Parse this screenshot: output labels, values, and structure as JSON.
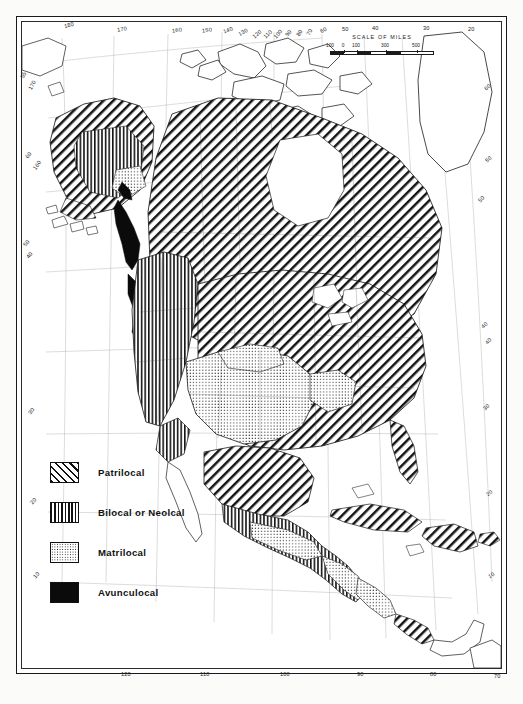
{
  "map": {
    "title": "North America residence pattern distribution map",
    "scale": {
      "title": "SCALE OF MILES",
      "labels": [
        "100",
        "0",
        "100",
        "300",
        "500"
      ],
      "positions": [
        0,
        13,
        26,
        55,
        86
      ]
    },
    "legend": {
      "items": [
        {
          "pattern": "diagonal-hatch",
          "label": "Patrilocal",
          "swatch_class": "sw-patri"
        },
        {
          "pattern": "vertical-lines",
          "label": "Bilocal or Neolcal",
          "swatch_class": "sw-bilocal"
        },
        {
          "pattern": "dotted",
          "label": "Matrilocal",
          "swatch_class": "sw-matri"
        },
        {
          "pattern": "solid-black",
          "label": "Avunculocal",
          "swatch_class": "sw-avunc"
        }
      ]
    },
    "graticule": {
      "top_labels": [
        "180",
        "170",
        "160",
        "150",
        "140",
        "130",
        "120",
        "110",
        "100",
        "90",
        "80",
        "70",
        "60",
        "50",
        "40",
        "30",
        "20"
      ],
      "bottom_labels": [
        "120",
        "110",
        "100",
        "90",
        "80",
        "70"
      ],
      "left_labels": [
        "55",
        "60",
        "50",
        "40",
        "30",
        "20",
        "10"
      ],
      "right_labels": [
        "60",
        "50",
        "40",
        "30",
        "20",
        "10"
      ],
      "right_meridian_labels": [
        "50",
        "40"
      ],
      "left_meridian_labels": [
        "170",
        "160"
      ]
    },
    "colors": {
      "ink": "#1a1a1a",
      "paper": "#ffffff",
      "avunculocal": "#0b0b0b"
    }
  }
}
